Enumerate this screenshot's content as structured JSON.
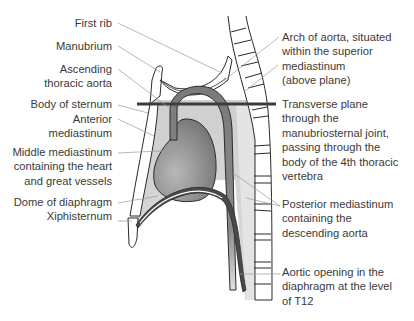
{
  "diagram": {
    "colors": {
      "outline": "#2a2a2a",
      "leader": "#9a9a9a",
      "plane": "#3c3c3c",
      "mediastinum_fill": "#d2d2d2",
      "heart_fill": "#8a8a8a",
      "aorta_fill": "#7a7a7a",
      "bone_fill": "#ffffff"
    },
    "left_labels": [
      {
        "id": "first-rib",
        "lines": [
          "First rib"
        ]
      },
      {
        "id": "manubrium",
        "lines": [
          "Manubrium"
        ]
      },
      {
        "id": "ascending-aorta",
        "lines": [
          "Ascending",
          "thoracic aorta"
        ]
      },
      {
        "id": "body-of-sternum",
        "lines": [
          "Body of sternum"
        ]
      },
      {
        "id": "anterior-mediastinum",
        "lines": [
          "Anterior",
          "mediastinum"
        ]
      },
      {
        "id": "middle-mediastinum",
        "lines": [
          "Middle mediastinum",
          "containing the heart",
          "and great vessels"
        ]
      },
      {
        "id": "dome-of-diaphragm",
        "lines": [
          "Dome of diaphragm"
        ]
      },
      {
        "id": "xiphisternum",
        "lines": [
          "Xiphisternum"
        ]
      }
    ],
    "right_labels": [
      {
        "id": "arch-of-aorta",
        "lines": [
          "Arch of aorta, situated",
          "within the superior",
          "mediastinum",
          "(above plane)"
        ]
      },
      {
        "id": "transverse-plane",
        "lines": [
          "Transverse plane",
          "through the",
          "manubriosternal joint,",
          "passing through the",
          "body of the 4th thoracic",
          "vertebra"
        ]
      },
      {
        "id": "posterior-mediastinum",
        "lines": [
          "Posterior mediastinum",
          "containing the",
          "descending aorta"
        ]
      },
      {
        "id": "aortic-opening",
        "lines": [
          "Aortic opening in the",
          "diaphragm at the level",
          "of T12"
        ]
      }
    ]
  }
}
